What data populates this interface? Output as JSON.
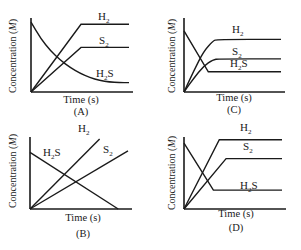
{
  "chart_data": [
    {
      "type": "line",
      "panel": "A",
      "xlabel": "Time (s)",
      "ylabel": "Concentration (M)",
      "xlim": [
        0,
        10
      ],
      "ylim": [
        0,
        10
      ],
      "grid": false,
      "series": [
        {
          "name": "H2",
          "label_main": "H",
          "label_sub": "2",
          "label_tail": "",
          "shape": "linear-rise-then-plateau",
          "points": [
            [
              0,
              0
            ],
            [
              5.1,
              9.4
            ],
            [
              10,
              9.4
            ]
          ]
        },
        {
          "name": "S2",
          "label_main": "S",
          "label_sub": "2",
          "label_tail": "",
          "shape": "linear-rise-then-plateau",
          "points": [
            [
              0,
              0
            ],
            [
              5.1,
              6.2
            ],
            [
              10,
              6.2
            ]
          ]
        },
        {
          "name": "H2S",
          "label_main": "H",
          "label_sub": "2",
          "label_tail": "S",
          "shape": "exponential-decay",
          "points": [
            [
              0,
              9.7
            ],
            [
              1,
              7.4
            ],
            [
              2,
              5.7
            ],
            [
              3,
              4.4
            ],
            [
              4,
              3.4
            ],
            [
              5,
              2.6
            ],
            [
              6,
              2.0
            ],
            [
              7,
              1.6
            ],
            [
              8,
              1.4
            ],
            [
              9,
              1.3
            ],
            [
              10,
              1.3
            ]
          ]
        }
      ]
    },
    {
      "type": "line",
      "panel": "B",
      "xlabel": "Time (s)",
      "ylabel": "Concentration (M)",
      "xlim": [
        0,
        10
      ],
      "ylim": [
        0,
        10
      ],
      "grid": false,
      "series": [
        {
          "name": "H2",
          "label_main": "H",
          "label_sub": "2",
          "label_tail": "",
          "shape": "linear-rise",
          "points": [
            [
              0,
              0
            ],
            [
              7.1,
              10
            ]
          ]
        },
        {
          "name": "S2",
          "label_main": "S",
          "label_sub": "2",
          "label_tail": "",
          "shape": "linear-rise",
          "points": [
            [
              0,
              0
            ],
            [
              10,
              8.3
            ]
          ]
        },
        {
          "name": "H2S",
          "label_main": "H",
          "label_sub": "2",
          "label_tail": "S",
          "shape": "linear-decay",
          "points": [
            [
              0,
              8.1
            ],
            [
              9.0,
              0
            ]
          ]
        }
      ]
    },
    {
      "type": "line",
      "panel": "C",
      "xlabel": "Time (s)",
      "ylabel": "Concentration (M)",
      "xlim": [
        0,
        10
      ],
      "ylim": [
        0,
        10
      ],
      "grid": false,
      "series": [
        {
          "name": "H2",
          "label_main": "H",
          "label_sub": "2",
          "label_tail": "",
          "shape": "curved-rise-then-plateau",
          "points": [
            [
              0,
              0
            ],
            [
              1,
              2.9
            ],
            [
              2,
              5.6
            ],
            [
              3,
              7.1
            ],
            [
              3.4,
              7.3
            ],
            [
              10,
              7.3
            ]
          ]
        },
        {
          "name": "S2",
          "label_main": "S",
          "label_sub": "2",
          "label_tail": "",
          "shape": "curved-rise-then-plateau",
          "points": [
            [
              0,
              0
            ],
            [
              1,
              1.9
            ],
            [
              2,
              3.6
            ],
            [
              3,
              4.5
            ],
            [
              3.6,
              4.6
            ],
            [
              10,
              4.6
            ]
          ]
        },
        {
          "name": "H2S",
          "label_main": "H",
          "label_sub": "2",
          "label_tail": "S",
          "shape": "linear-decay-then-plateau",
          "points": [
            [
              0,
              8.5
            ],
            [
              2.5,
              2.8
            ],
            [
              10,
              2.8
            ]
          ]
        }
      ]
    },
    {
      "type": "line",
      "panel": "D",
      "xlabel": "Time (s)",
      "ylabel": "Concentration (M)",
      "xlim": [
        0,
        10
      ],
      "ylim": [
        0,
        10
      ],
      "grid": false,
      "series": [
        {
          "name": "H2",
          "label_main": "H",
          "label_sub": "2",
          "label_tail": "",
          "shape": "linear-rise-then-plateau",
          "points": [
            [
              0,
              0
            ],
            [
              3.6,
              9.9
            ],
            [
              10,
              9.9
            ]
          ]
        },
        {
          "name": "S2",
          "label_main": "S",
          "label_sub": "2",
          "label_tail": "",
          "shape": "linear-rise-then-plateau",
          "points": [
            [
              0,
              0
            ],
            [
              4.3,
              7.2
            ],
            [
              10,
              7.2
            ]
          ]
        },
        {
          "name": "H2S",
          "label_main": "H",
          "label_sub": "2",
          "label_tail": "S",
          "shape": "linear-decay-then-plateau",
          "points": [
            [
              0,
              9.4
            ],
            [
              3.0,
              2.7
            ],
            [
              10,
              2.7
            ]
          ]
        }
      ]
    }
  ]
}
